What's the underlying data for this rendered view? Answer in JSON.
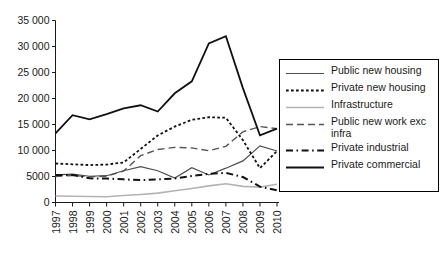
{
  "chart_data": {
    "type": "line",
    "title": "",
    "xlabel": "",
    "ylabel": "",
    "x": [
      1997,
      1998,
      1999,
      2000,
      2001,
      2002,
      2003,
      2004,
      2005,
      2006,
      2007,
      2008,
      2009,
      2010
    ],
    "categories": [
      "1997",
      "1998",
      "1999",
      "2000",
      "2001",
      "2002",
      "2003",
      "2004",
      "2005",
      "2006",
      "2007",
      "2008",
      "2009",
      "2010"
    ],
    "ylim": [
      0,
      35000
    ],
    "yticks": [
      0,
      5000,
      10000,
      15000,
      20000,
      25000,
      30000,
      35000
    ],
    "ytick_labels": [
      "0",
      "5000",
      "10 000",
      "15 000",
      "20 000",
      "25 000",
      "30 000",
      "35 000"
    ],
    "grid": false,
    "legend_position": "right",
    "series": [
      {
        "name": "Public new housing",
        "style": "solid",
        "color": "#4d4d4d",
        "width": 1.2,
        "values": [
          5300,
          5450,
          5050,
          5150,
          6100,
          6900,
          6100,
          4700,
          6700,
          5300,
          6600,
          8000,
          10900,
          9900
        ]
      },
      {
        "name": "Private new housing",
        "style": "dotted",
        "color": "#111111",
        "width": 1.8,
        "values": [
          7500,
          7350,
          7200,
          7300,
          7700,
          10300,
          12900,
          14600,
          15900,
          16400,
          16300,
          12000,
          6600,
          9900
        ]
      },
      {
        "name": "Infrastructure",
        "style": "solid",
        "color": "#b3b3b3",
        "width": 1.6,
        "values": [
          1250,
          1200,
          1150,
          1100,
          1350,
          1550,
          1800,
          2250,
          2700,
          3200,
          3600,
          3100,
          2950,
          3500
        ]
      },
      {
        "name": "Public new work exc infra",
        "style": "longdash",
        "color": "#555555",
        "width": 1.4,
        "values": [
          5000,
          5200,
          4950,
          5050,
          6050,
          9000,
          10200,
          10600,
          10500,
          9950,
          10800,
          13600,
          14600,
          14200
        ]
      },
      {
        "name": "Private industrial",
        "style": "dashdot",
        "color": "#111111",
        "width": 2.0,
        "values": [
          5300,
          5300,
          4650,
          4600,
          4450,
          4300,
          4450,
          4600,
          5100,
          5500,
          5700,
          4900,
          3050,
          2350
        ]
      },
      {
        "name": "Private commercial",
        "style": "solid",
        "color": "#111111",
        "width": 1.8,
        "values": [
          13300,
          16800,
          16000,
          17000,
          18100,
          18700,
          17500,
          21000,
          23300,
          30600,
          32000,
          22000,
          12900,
          14200
        ]
      }
    ]
  },
  "legend": {
    "items": [
      {
        "label": "Public new housing",
        "swatch": "legend-swatch-solid-gray"
      },
      {
        "label": "Private new housing",
        "swatch": "legend-swatch-dotted"
      },
      {
        "label": "Infrastructure",
        "swatch": "legend-swatch-solid-light"
      },
      {
        "label": "Public new work exc\ninfra",
        "swatch": "legend-swatch-longdash"
      },
      {
        "label": "Private industrial",
        "swatch": "legend-swatch-dashdot"
      },
      {
        "label": "Private commercial",
        "swatch": "legend-swatch-solid-black"
      }
    ]
  }
}
